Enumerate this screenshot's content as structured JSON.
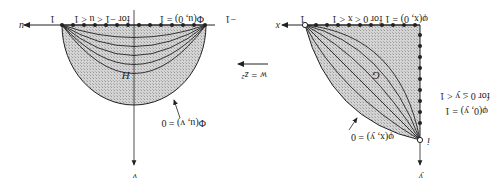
{
  "figure": {
    "orientation": "rotated-180",
    "mapping_label": "w = z²",
    "left_panel": {
      "region_label": "H",
      "horizontal_axis_label": "u",
      "vertical_axis_label": "v",
      "left_endpoint_label": "−1",
      "right_endpoint_label": "1",
      "boundary_condition_top": "Φ(u, 0) = 1",
      "boundary_condition_top_range": "for −1 < u < 1",
      "boundary_condition_arc": "Φ(u, v) = 0"
    },
    "right_panel": {
      "region_label": "G",
      "horizontal_axis_label": "x",
      "vertical_axis_label": "y",
      "x_endpoint_label": "1",
      "y_endpoint_label": "i",
      "boundary_condition_top": "φ(x, 0) = 1 for 0 < x < 1",
      "boundary_condition_side": "φ(0, y) = 1",
      "boundary_condition_side_range": "for 0 ≤ y < 1",
      "boundary_condition_arc": "φ(x, y) = 0"
    },
    "colors": {
      "ink": "#222222",
      "shade": "#c9c9c9",
      "background": "#ffffff"
    }
  }
}
